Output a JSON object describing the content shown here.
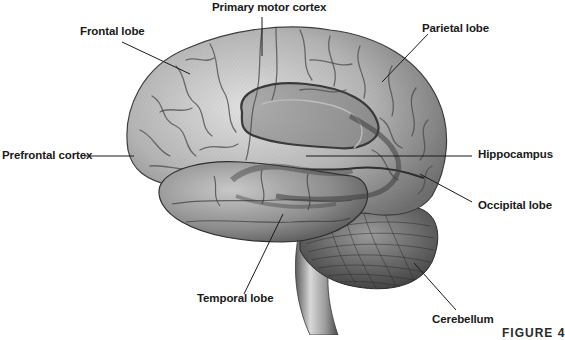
{
  "figure": {
    "caption": "FIGURE 4",
    "colors": {
      "background": "#ffffff",
      "cortex_light": "#d6d6d6",
      "cortex_mid": "#9a9a9a",
      "cortex_dark": "#5a5a5a",
      "limbic_overlay": "#4a4a4a",
      "leader_line": "#1a1a1a",
      "label_text": "#1a1a1a"
    }
  },
  "labels": {
    "primary_motor_cortex": "Primary motor cortex",
    "frontal_lobe": "Frontal lobe",
    "parietal_lobe": "Parietal lobe",
    "prefrontal_cortex": "Prefrontal cortex",
    "hippocampus": "Hippocampus",
    "occipital_lobe": "Occipital lobe",
    "temporal_lobe": "Temporal lobe",
    "cerebellum": "Cerebellum"
  }
}
